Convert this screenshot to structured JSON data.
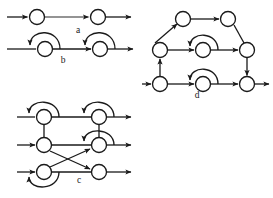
{
  "figure": {
    "background_color": "#ffffff",
    "stroke_color": "#1a1a1a",
    "node_fill": "#ffffff",
    "node_radius": 7.5,
    "panels": [
      {
        "id": "a",
        "label": "a",
        "label_x": 78,
        "label_y": 31,
        "description": "Two states in a single horizontal chain with an incoming arrow, a link between them, and an outgoing arrow.",
        "nodes": [
          {
            "name": "a1",
            "cx": 37,
            "cy": 17
          },
          {
            "name": "a2",
            "cx": 98,
            "cy": 17
          }
        ],
        "edges": [
          {
            "from": "entry",
            "to": "a1",
            "kind": "straight"
          },
          {
            "from": "a1",
            "to": "a2",
            "kind": "straight"
          },
          {
            "from": "a2",
            "to": "exit",
            "kind": "straight"
          }
        ],
        "self_loops": []
      },
      {
        "id": "b",
        "label": "b",
        "label_x": 63,
        "label_y": 61,
        "description": "Two states in a horizontal chain, each carrying a self loop arc above it that returns leftward.",
        "nodes": [
          {
            "name": "b1",
            "cx": 45,
            "cy": 49
          },
          {
            "name": "b2",
            "cx": 100,
            "cy": 49
          }
        ],
        "edges": [
          {
            "from": "entry",
            "to": "b1",
            "kind": "straight"
          },
          {
            "from": "b1",
            "to": "b2",
            "kind": "straight"
          },
          {
            "from": "b2",
            "to": "exit",
            "kind": "straight"
          }
        ],
        "self_loops": [
          {
            "on": "b1",
            "direction": "left"
          },
          {
            "on": "b2",
            "direction": "left"
          }
        ]
      },
      {
        "id": "c",
        "label": "c",
        "label_x": 79,
        "label_y": 181,
        "description": "Three horizontal rows of two states each, with vertical links between rows, two crossing diagonal edges from the lower-left region to the middle-right and lower-right states, and three self loops.",
        "nodes": [
          {
            "name": "c1",
            "cx": 44,
            "cy": 117
          },
          {
            "name": "c2",
            "cx": 99,
            "cy": 117
          },
          {
            "name": "c3",
            "cx": 44,
            "cy": 145
          },
          {
            "name": "c4",
            "cx": 99,
            "cy": 145
          },
          {
            "name": "c5",
            "cx": 44,
            "cy": 172
          },
          {
            "name": "c6",
            "cx": 99,
            "cy": 172
          }
        ],
        "edges": [
          {
            "from": "entry",
            "to": "c1",
            "kind": "straight"
          },
          {
            "from": "c1",
            "to": "c2",
            "kind": "straight"
          },
          {
            "from": "c2",
            "to": "exit",
            "kind": "straight"
          },
          {
            "from": "entry",
            "to": "c3",
            "kind": "straight"
          },
          {
            "from": "c3",
            "to": "c4",
            "kind": "straight"
          },
          {
            "from": "c4",
            "to": "exit",
            "kind": "straight"
          },
          {
            "from": "entry",
            "to": "c5",
            "kind": "straight"
          },
          {
            "from": "c5",
            "to": "c6",
            "kind": "straight"
          },
          {
            "from": "c6",
            "to": "exit",
            "kind": "straight"
          },
          {
            "from": "c1",
            "to": "c3",
            "kind": "vertical"
          },
          {
            "from": "c2",
            "to": "c4",
            "kind": "vertical"
          },
          {
            "from": "c3",
            "to": "c6",
            "kind": "diagonal"
          },
          {
            "from": "c5",
            "to": "c4",
            "kind": "diagonal"
          }
        ],
        "self_loops": [
          {
            "on": "c1",
            "direction": "left"
          },
          {
            "on": "c2",
            "direction": "left"
          },
          {
            "on": "c4",
            "direction": "left"
          },
          {
            "on": "c5",
            "direction": "left-below"
          }
        ]
      },
      {
        "id": "d",
        "label": "d",
        "label_x": 197,
        "label_y": 96,
        "description": "Six states arranged in three tiers: a top pair, a middle row of three, and a bottom row of three; connected by diagonal, vertical and horizontal edges with two back-arcs.",
        "nodes": [
          {
            "name": "d1",
            "cx": 183,
            "cy": 19
          },
          {
            "name": "d2",
            "cx": 228,
            "cy": 19
          },
          {
            "name": "d3",
            "cx": 160,
            "cy": 50
          },
          {
            "name": "d4",
            "cx": 203,
            "cy": 50
          },
          {
            "name": "d5",
            "cx": 247,
            "cy": 50
          },
          {
            "name": "d6",
            "cx": 160,
            "cy": 84
          },
          {
            "name": "d7",
            "cx": 203,
            "cy": 84
          },
          {
            "name": "d8",
            "cx": 247,
            "cy": 84
          }
        ],
        "edges": [
          {
            "from": "d3",
            "to": "d1",
            "kind": "diagonal"
          },
          {
            "from": "d1",
            "to": "d2",
            "kind": "straight"
          },
          {
            "from": "d2",
            "to": "d5",
            "kind": "diagonal"
          },
          {
            "from": "d3",
            "to": "d4",
            "kind": "straight"
          },
          {
            "from": "d4",
            "to": "d5",
            "kind": "straight"
          },
          {
            "from": "d6",
            "to": "d3",
            "kind": "vertical"
          },
          {
            "from": "d5",
            "to": "d8",
            "kind": "vertical"
          },
          {
            "from": "entry",
            "to": "d6",
            "kind": "straight"
          },
          {
            "from": "d6",
            "to": "d7",
            "kind": "straight"
          },
          {
            "from": "d7",
            "to": "d8",
            "kind": "straight"
          },
          {
            "from": "d8",
            "to": "exit",
            "kind": "straight"
          }
        ],
        "self_loops": [
          {
            "on": "d4",
            "direction": "left-arc"
          },
          {
            "on": "d7",
            "direction": "left-arc"
          }
        ]
      }
    ]
  }
}
